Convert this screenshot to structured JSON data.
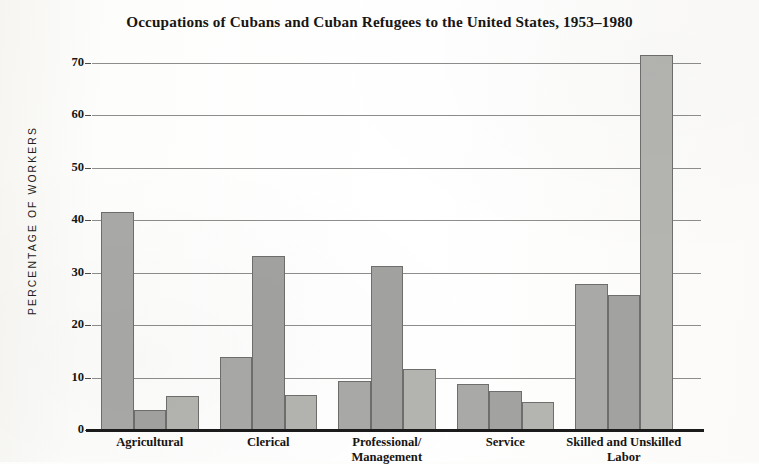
{
  "chart_data": {
    "type": "bar",
    "title": "Occupations of Cubans and Cuban Refugees to the United States, 1953–1980",
    "xlabel": "",
    "ylabel": "PERCENTAGE OF WORKERS",
    "ylim": [
      0,
      70
    ],
    "ytick_labels": [
      "70",
      "60",
      "50",
      "40",
      "30",
      "20",
      "10",
      "0"
    ],
    "ytick_values": [
      70,
      60,
      50,
      40,
      30,
      20,
      10,
      0
    ],
    "grid": true,
    "legend": "none",
    "categories": [
      "Agricultural",
      "Clerical",
      "Professional/\nManagement",
      "Service",
      "Skilled and Unskilled\nLabor"
    ],
    "series": [
      {
        "name": "series-1",
        "values": [
          41.5,
          14.0,
          9.4,
          8.7,
          27.8
        ]
      },
      {
        "name": "series-2",
        "values": [
          3.9,
          33.2,
          31.3,
          7.4,
          25.7
        ]
      },
      {
        "name": "series-3",
        "values": [
          6.4,
          6.6,
          11.6,
          5.3,
          71.5
        ]
      }
    ],
    "bar_colors": [
      "#a9a9a7",
      "#a2a2a0",
      "#b4b4b1"
    ],
    "bar_border_color": "#6e6e6c",
    "grid_color": "#8d8d8b",
    "axis_color": "#1b1b1b",
    "background_color": "#fdfdfb"
  }
}
